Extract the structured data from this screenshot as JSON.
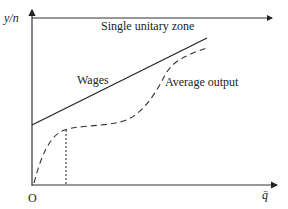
{
  "diagram": {
    "y_axis_label": "y/n",
    "x_axis_label": "q̄",
    "origin_label": "O",
    "top_zone_label": "Single unitary zone",
    "curves": [
      {
        "name": "Wages",
        "style": "solid"
      },
      {
        "name": "Average output",
        "style": "dashed"
      }
    ],
    "wages_label": "Wages",
    "average_output_label": "Average output",
    "reference_line": {
      "style": "dotted",
      "orientation": "vertical"
    },
    "colors": {
      "line": "#222222",
      "background": "#ffffff"
    }
  }
}
